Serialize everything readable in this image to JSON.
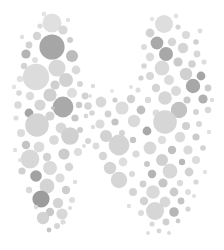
{
  "artwork": {
    "title": "Thyroid Gland Circle Mosaic",
    "subject": "thyroid-gland-silhouette",
    "description": "Butterfly shaped thyroid gland formed from overlapping grayscale circles",
    "background_color": "#ffffff",
    "canvas": {
      "width": 224,
      "height": 250
    }
  },
  "palette": {
    "lightest": "#eeeeee",
    "light": "#e2e2e2",
    "mid_light": "#d6d6d6",
    "mid": "#c8c8c8",
    "mid_dark": "#b8b8b8",
    "dark": "#a8a8a8",
    "darkest": "#8f8f8f"
  },
  "chart_data": {
    "type": "scatter",
    "subtitle": "",
    "xlabel": "",
    "ylabel": "",
    "xlim": [
      0,
      224
    ],
    "ylim": [
      0,
      250
    ],
    "grid": false,
    "legend": "none",
    "marker": "circle",
    "note": "Each point is a filled circle; r = radius in px, c = fill hex, drawn in image coordinates with y increasing downward.",
    "points": [
      {
        "x": 52,
        "y": 23,
        "r": 9.5,
        "c": "#e0e0e0"
      },
      {
        "x": 40,
        "y": 26,
        "r": 2.6,
        "c": "#dcdcdc"
      },
      {
        "x": 63,
        "y": 30,
        "r": 4.6,
        "c": "#d8d8d8"
      },
      {
        "x": 37,
        "y": 36,
        "r": 4.2,
        "c": "#d4d4d4"
      },
      {
        "x": 70,
        "y": 40,
        "r": 3.0,
        "c": "#cfcfcf"
      },
      {
        "x": 52,
        "y": 47,
        "r": 12.6,
        "c": "#a6a6a6"
      },
      {
        "x": 29,
        "y": 45,
        "r": 3.4,
        "c": "#d2d2d2"
      },
      {
        "x": 26,
        "y": 54,
        "r": 4.6,
        "c": "#b4b4b4"
      },
      {
        "x": 72,
        "y": 56,
        "r": 6.0,
        "c": "#bcbcbc"
      },
      {
        "x": 35,
        "y": 60,
        "r": 3.0,
        "c": "#e0e0e0"
      },
      {
        "x": 24,
        "y": 66,
        "r": 3.2,
        "c": "#d4d4d4"
      },
      {
        "x": 57,
        "y": 68,
        "r": 8.6,
        "c": "#d8d8d8"
      },
      {
        "x": 76,
        "y": 70,
        "r": 4.4,
        "c": "#dadada"
      },
      {
        "x": 36,
        "y": 77,
        "r": 13.2,
        "c": "#dcdcdc"
      },
      {
        "x": 20,
        "y": 79,
        "r": 3.2,
        "c": "#e2e2e2"
      },
      {
        "x": 66,
        "y": 80,
        "r": 7.0,
        "c": "#d2d2d2"
      },
      {
        "x": 80,
        "y": 84,
        "r": 3.0,
        "c": "#d6d6d6"
      },
      {
        "x": 55,
        "y": 85,
        "r": 4.6,
        "c": "#cfcfcf"
      },
      {
        "x": 19,
        "y": 93,
        "r": 2.8,
        "c": "#d8d8d8"
      },
      {
        "x": 50,
        "y": 95,
        "r": 6.6,
        "c": "#d0d0d0"
      },
      {
        "x": 72,
        "y": 93,
        "r": 5.0,
        "c": "#dedede"
      },
      {
        "x": 30,
        "y": 96,
        "r": 4.2,
        "c": "#dcdcdc"
      },
      {
        "x": 85,
        "y": 96,
        "r": 3.4,
        "c": "#d2d2d2"
      },
      {
        "x": 18,
        "y": 105,
        "r": 3.8,
        "c": "#dadada"
      },
      {
        "x": 40,
        "y": 105,
        "r": 5.6,
        "c": "#d6d6d6"
      },
      {
        "x": 63,
        "y": 107,
        "r": 10.4,
        "c": "#a9a9a9"
      },
      {
        "x": 79,
        "y": 105,
        "r": 3.2,
        "c": "#cacaca"
      },
      {
        "x": 88,
        "y": 106,
        "r": 3.8,
        "c": "#d4d4d4"
      },
      {
        "x": 29,
        "y": 113,
        "r": 4.4,
        "c": "#a4a4a4"
      },
      {
        "x": 50,
        "y": 116,
        "r": 4.6,
        "c": "#d2d2d2"
      },
      {
        "x": 16,
        "y": 118,
        "r": 2.6,
        "c": "#dedede"
      },
      {
        "x": 75,
        "y": 118,
        "r": 3.6,
        "c": "#c8c8c8"
      },
      {
        "x": 86,
        "y": 116,
        "r": 2.4,
        "c": "#d8d8d8"
      },
      {
        "x": 37,
        "y": 125,
        "r": 11.8,
        "c": "#d4d4d4"
      },
      {
        "x": 61,
        "y": 128,
        "r": 5.4,
        "c": "#d8d8d8"
      },
      {
        "x": 21,
        "y": 133,
        "r": 4.0,
        "c": "#dcdcdc"
      },
      {
        "x": 80,
        "y": 130,
        "r": 3.0,
        "c": "#cecece"
      },
      {
        "x": 70,
        "y": 136,
        "r": 8.8,
        "c": "#d0d0d0"
      },
      {
        "x": 54,
        "y": 140,
        "r": 4.8,
        "c": "#dadada"
      },
      {
        "x": 26,
        "y": 145,
        "r": 4.2,
        "c": "#c4c4c4"
      },
      {
        "x": 39,
        "y": 147,
        "r": 5.4,
        "c": "#dcdcdc"
      },
      {
        "x": 88,
        "y": 141,
        "r": 3.0,
        "c": "#d6d6d6"
      },
      {
        "x": 47,
        "y": 157,
        "r": 4.2,
        "c": "#d2d2d2"
      },
      {
        "x": 30,
        "y": 159,
        "r": 9.4,
        "c": "#d8d8d8"
      },
      {
        "x": 64,
        "y": 154,
        "r": 5.6,
        "c": "#cbcbcb"
      },
      {
        "x": 78,
        "y": 152,
        "r": 4.0,
        "c": "#dedede"
      },
      {
        "x": 50,
        "y": 168,
        "r": 7.0,
        "c": "#dadada"
      },
      {
        "x": 22,
        "y": 171,
        "r": 3.6,
        "c": "#d0d0d0"
      },
      {
        "x": 69,
        "y": 167,
        "r": 4.2,
        "c": "#d6d6d6"
      },
      {
        "x": 36,
        "y": 176,
        "r": 5.8,
        "c": "#a2a2a2"
      },
      {
        "x": 60,
        "y": 178,
        "r": 4.6,
        "c": "#dcdcdc"
      },
      {
        "x": 47,
        "y": 186,
        "r": 7.4,
        "c": "#d4d4d4"
      },
      {
        "x": 29,
        "y": 190,
        "r": 3.2,
        "c": "#dadada"
      },
      {
        "x": 66,
        "y": 190,
        "r": 4.2,
        "c": "#cdcdcd"
      },
      {
        "x": 41,
        "y": 199,
        "r": 8.6,
        "c": "#9c9c9c"
      },
      {
        "x": 58,
        "y": 203,
        "r": 5.2,
        "c": "#d4d4d4"
      },
      {
        "x": 72,
        "y": 200,
        "r": 3.0,
        "c": "#dedede"
      },
      {
        "x": 50,
        "y": 212,
        "r": 4.2,
        "c": "#c8c8c8"
      },
      {
        "x": 62,
        "y": 214,
        "r": 5.6,
        "c": "#d8d8d8"
      },
      {
        "x": 43,
        "y": 218,
        "r": 6.2,
        "c": "#d2d2d2"
      },
      {
        "x": 57,
        "y": 226,
        "r": 3.0,
        "c": "#d6d6d6"
      },
      {
        "x": 49,
        "y": 230,
        "r": 2.4,
        "c": "#c6c6c6"
      },
      {
        "x": 63,
        "y": 222,
        "r": 2.6,
        "c": "#dcdcdc"
      },
      {
        "x": 164,
        "y": 24,
        "r": 9.0,
        "c": "#dedede"
      },
      {
        "x": 178,
        "y": 27,
        "r": 2.6,
        "c": "#d6d6d6"
      },
      {
        "x": 150,
        "y": 33,
        "r": 4.4,
        "c": "#d2d2d2"
      },
      {
        "x": 186,
        "y": 35,
        "r": 4.0,
        "c": "#dadada"
      },
      {
        "x": 157,
        "y": 43,
        "r": 6.4,
        "c": "#a9a9a9"
      },
      {
        "x": 172,
        "y": 42,
        "r": 4.2,
        "c": "#d6d6d6"
      },
      {
        "x": 196,
        "y": 42,
        "r": 2.8,
        "c": "#d0d0d0"
      },
      {
        "x": 144,
        "y": 47,
        "r": 3.0,
        "c": "#dcdcdc"
      },
      {
        "x": 183,
        "y": 48,
        "r": 5.2,
        "c": "#d4d4d4"
      },
      {
        "x": 166,
        "y": 54,
        "r": 7.0,
        "c": "#a8a8a8"
      },
      {
        "x": 197,
        "y": 54,
        "r": 3.4,
        "c": "#d8d8d8"
      },
      {
        "x": 150,
        "y": 57,
        "r": 4.2,
        "c": "#dcdcdc"
      },
      {
        "x": 178,
        "y": 62,
        "r": 4.6,
        "c": "#cbcbcb"
      },
      {
        "x": 192,
        "y": 64,
        "r": 3.8,
        "c": "#d2d2d2"
      },
      {
        "x": 162,
        "y": 68,
        "r": 7.4,
        "c": "#dadada"
      },
      {
        "x": 144,
        "y": 66,
        "r": 2.8,
        "c": "#d6d6d6"
      },
      {
        "x": 204,
        "y": 62,
        "r": 2.6,
        "c": "#dedede"
      },
      {
        "x": 186,
        "y": 74,
        "r": 6.2,
        "c": "#d0d0d0"
      },
      {
        "x": 150,
        "y": 76,
        "r": 4.0,
        "c": "#d8d8d8"
      },
      {
        "x": 169,
        "y": 80,
        "r": 5.0,
        "c": "#dcdcdc"
      },
      {
        "x": 201,
        "y": 76,
        "r": 4.4,
        "c": "#a5a5a5"
      },
      {
        "x": 141,
        "y": 78,
        "r": 2.6,
        "c": "#d2d2d2"
      },
      {
        "x": 193,
        "y": 86,
        "r": 7.2,
        "c": "#a7a7a7"
      },
      {
        "x": 156,
        "y": 88,
        "r": 4.2,
        "c": "#d4d4d4"
      },
      {
        "x": 176,
        "y": 91,
        "r": 5.0,
        "c": "#dadada"
      },
      {
        "x": 208,
        "y": 88,
        "r": 3.4,
        "c": "#cdcdcd"
      },
      {
        "x": 138,
        "y": 90,
        "r": 2.6,
        "c": "#dedede"
      },
      {
        "x": 165,
        "y": 98,
        "r": 6.8,
        "c": "#d6d6d6"
      },
      {
        "x": 187,
        "y": 100,
        "r": 3.6,
        "c": "#cacaca"
      },
      {
        "x": 203,
        "y": 99,
        "r": 4.6,
        "c": "#b0b0b0"
      },
      {
        "x": 148,
        "y": 100,
        "r": 3.2,
        "c": "#dadada"
      },
      {
        "x": 131,
        "y": 99,
        "r": 4.2,
        "c": "#d0d0d0"
      },
      {
        "x": 115,
        "y": 100,
        "r": 2.6,
        "c": "#cfcfcf"
      },
      {
        "x": 101,
        "y": 102,
        "r": 5.4,
        "c": "#d8d8d8"
      },
      {
        "x": 122,
        "y": 108,
        "r": 6.6,
        "c": "#dcdcdc"
      },
      {
        "x": 141,
        "y": 110,
        "r": 4.4,
        "c": "#bebebe"
      },
      {
        "x": 179,
        "y": 110,
        "r": 8.2,
        "c": "#c2c2c2"
      },
      {
        "x": 196,
        "y": 112,
        "r": 3.0,
        "c": "#d4d4d4"
      },
      {
        "x": 208,
        "y": 110,
        "r": 3.2,
        "c": "#d8d8d8"
      },
      {
        "x": 156,
        "y": 113,
        "r": 3.4,
        "c": "#dcdcdc"
      },
      {
        "x": 108,
        "y": 114,
        "r": 3.4,
        "c": "#d2d2d2"
      },
      {
        "x": 92,
        "y": 113,
        "r": 2.8,
        "c": "#d6d6d6"
      },
      {
        "x": 165,
        "y": 122,
        "r": 11.8,
        "c": "#d6d6d6"
      },
      {
        "x": 134,
        "y": 121,
        "r": 6.2,
        "c": "#dadada"
      },
      {
        "x": 115,
        "y": 122,
        "r": 3.6,
        "c": "#c4c4c4"
      },
      {
        "x": 100,
        "y": 124,
        "r": 4.6,
        "c": "#dcdcdc"
      },
      {
        "x": 186,
        "y": 126,
        "r": 4.0,
        "c": "#d0d0d0"
      },
      {
        "x": 199,
        "y": 124,
        "r": 3.0,
        "c": "#d8d8d8"
      },
      {
        "x": 147,
        "y": 131,
        "r": 4.4,
        "c": "#a8a8a8"
      },
      {
        "x": 122,
        "y": 133,
        "r": 3.0,
        "c": "#d4d4d4"
      },
      {
        "x": 106,
        "y": 136,
        "r": 6.0,
        "c": "#d2d2d2"
      },
      {
        "x": 180,
        "y": 137,
        "r": 5.2,
        "c": "#dadada"
      },
      {
        "x": 196,
        "y": 137,
        "r": 3.6,
        "c": "#cbcbcb"
      },
      {
        "x": 162,
        "y": 140,
        "r": 4.2,
        "c": "#dedede"
      },
      {
        "x": 133,
        "y": 140,
        "r": 3.2,
        "c": "#c6c6c6"
      },
      {
        "x": 119,
        "y": 145,
        "r": 10.4,
        "c": "#d4d4d4"
      },
      {
        "x": 96,
        "y": 146,
        "r": 3.4,
        "c": "#dcdcdc"
      },
      {
        "x": 150,
        "y": 148,
        "r": 6.4,
        "c": "#d8d8d8"
      },
      {
        "x": 172,
        "y": 150,
        "r": 4.2,
        "c": "#c0c0c0"
      },
      {
        "x": 188,
        "y": 150,
        "r": 4.6,
        "c": "#dadada"
      },
      {
        "x": 203,
        "y": 148,
        "r": 2.8,
        "c": "#d2d2d2"
      },
      {
        "x": 136,
        "y": 154,
        "r": 3.6,
        "c": "#dadada"
      },
      {
        "x": 103,
        "y": 156,
        "r": 4.2,
        "c": "#d6d6d6"
      },
      {
        "x": 162,
        "y": 160,
        "r": 6.0,
        "c": "#d0d0d0"
      },
      {
        "x": 182,
        "y": 162,
        "r": 3.2,
        "c": "#b8b8b8"
      },
      {
        "x": 196,
        "y": 160,
        "r": 4.0,
        "c": "#dcdcdc"
      },
      {
        "x": 123,
        "y": 162,
        "r": 4.4,
        "c": "#dedede"
      },
      {
        "x": 147,
        "y": 164,
        "r": 3.0,
        "c": "#c9c9c9"
      },
      {
        "x": 110,
        "y": 168,
        "r": 6.2,
        "c": "#d4d4d4"
      },
      {
        "x": 170,
        "y": 171,
        "r": 7.4,
        "c": "#d8d8d8"
      },
      {
        "x": 152,
        "y": 174,
        "r": 4.2,
        "c": "#b4b4b4"
      },
      {
        "x": 189,
        "y": 172,
        "r": 4.4,
        "c": "#d2d2d2"
      },
      {
        "x": 132,
        "y": 174,
        "r": 3.0,
        "c": "#dadada"
      },
      {
        "x": 119,
        "y": 180,
        "r": 8.2,
        "c": "#d6d6d6"
      },
      {
        "x": 163,
        "y": 183,
        "r": 4.6,
        "c": "#c6c6c6"
      },
      {
        "x": 180,
        "y": 183,
        "r": 3.2,
        "c": "#dcdcdc"
      },
      {
        "x": 143,
        "y": 184,
        "r": 3.4,
        "c": "#d0d0d0"
      },
      {
        "x": 196,
        "y": 182,
        "r": 2.6,
        "c": "#d8d8d8"
      },
      {
        "x": 153,
        "y": 192,
        "r": 6.8,
        "c": "#dadada"
      },
      {
        "x": 133,
        "y": 192,
        "r": 4.0,
        "c": "#d4d4d4"
      },
      {
        "x": 174,
        "y": 192,
        "r": 4.4,
        "c": "#cbcbcb"
      },
      {
        "x": 188,
        "y": 192,
        "r": 3.0,
        "c": "#dedede"
      },
      {
        "x": 144,
        "y": 201,
        "r": 4.2,
        "c": "#d2d2d2"
      },
      {
        "x": 165,
        "y": 202,
        "r": 5.4,
        "c": "#d8d8d8"
      },
      {
        "x": 181,
        "y": 201,
        "r": 3.4,
        "c": "#c4c4c4"
      },
      {
        "x": 155,
        "y": 211,
        "r": 9.0,
        "c": "#d6d6d6"
      },
      {
        "x": 174,
        "y": 212,
        "r": 4.8,
        "c": "#b6b6b6"
      },
      {
        "x": 141,
        "y": 213,
        "r": 3.0,
        "c": "#dcdcdc"
      },
      {
        "x": 188,
        "y": 209,
        "r": 2.6,
        "c": "#d4d4d4"
      },
      {
        "x": 166,
        "y": 222,
        "r": 3.4,
        "c": "#d0d0d0"
      },
      {
        "x": 152,
        "y": 224,
        "r": 2.6,
        "c": "#dadada"
      },
      {
        "x": 178,
        "y": 221,
        "r": 2.4,
        "c": "#cdcdcd"
      },
      {
        "x": 159,
        "y": 231,
        "r": 2.4,
        "c": "#d6d6d6"
      },
      {
        "x": 44,
        "y": 14,
        "r": 2.4,
        "c": "#e4e4e4"
      },
      {
        "x": 68,
        "y": 20,
        "r": 2.2,
        "c": "#e2e2e2"
      },
      {
        "x": 176,
        "y": 16,
        "r": 2.4,
        "c": "#e2e2e2"
      },
      {
        "x": 152,
        "y": 19,
        "r": 2.2,
        "c": "#e4e4e4"
      },
      {
        "x": 22,
        "y": 37,
        "r": 2.2,
        "c": "#e0e0e0"
      },
      {
        "x": 200,
        "y": 31,
        "r": 2.4,
        "c": "#dedede"
      },
      {
        "x": 14,
        "y": 87,
        "r": 2.2,
        "c": "#e2e2e2"
      },
      {
        "x": 212,
        "y": 100,
        "r": 2.2,
        "c": "#dedede"
      },
      {
        "x": 93,
        "y": 127,
        "r": 2.2,
        "c": "#dedede"
      },
      {
        "x": 90,
        "y": 96,
        "r": 2.0,
        "c": "#e0e0e0"
      },
      {
        "x": 131,
        "y": 87,
        "r": 2.0,
        "c": "#e2e2e2"
      },
      {
        "x": 112,
        "y": 91,
        "r": 2.0,
        "c": "#e4e4e4"
      },
      {
        "x": 15,
        "y": 150,
        "r": 2.2,
        "c": "#e0e0e0"
      },
      {
        "x": 209,
        "y": 132,
        "r": 2.2,
        "c": "#e0e0e0"
      },
      {
        "x": 205,
        "y": 172,
        "r": 2.2,
        "c": "#e2e2e2"
      },
      {
        "x": 20,
        "y": 160,
        "r": 2.0,
        "c": "#dedede"
      },
      {
        "x": 75,
        "y": 182,
        "r": 2.2,
        "c": "#dedede"
      },
      {
        "x": 129,
        "y": 206,
        "r": 2.2,
        "c": "#e0e0e0"
      },
      {
        "x": 53,
        "y": 108,
        "r": 2.0,
        "c": "#c0c0c0"
      },
      {
        "x": 93,
        "y": 86,
        "r": 2.2,
        "c": "#dcdcdc"
      },
      {
        "x": 84,
        "y": 146,
        "r": 2.0,
        "c": "#dedede"
      },
      {
        "x": 194,
        "y": 196,
        "r": 2.0,
        "c": "#e0e0e0"
      },
      {
        "x": 36,
        "y": 207,
        "r": 2.2,
        "c": "#dadada"
      },
      {
        "x": 70,
        "y": 208,
        "r": 2.0,
        "c": "#dcdcdc"
      },
      {
        "x": 148,
        "y": 233,
        "r": 2.0,
        "c": "#dedede"
      },
      {
        "x": 169,
        "y": 233,
        "r": 2.0,
        "c": "#dcdcdc"
      }
    ]
  }
}
